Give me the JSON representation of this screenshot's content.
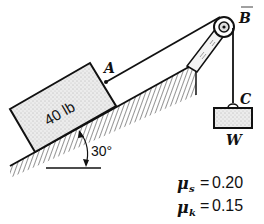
{
  "figure": {
    "type": "statics-problem",
    "block": {
      "label": "40 lb"
    },
    "points": {
      "A": "A",
      "B": "B",
      "C": "C"
    },
    "hanging_weight": {
      "label": "W"
    },
    "incline_angle": {
      "label": "30°"
    },
    "friction": {
      "static": {
        "symbol": "μ",
        "subscript": "s",
        "equals": "=",
        "value": "0.20"
      },
      "kinetic": {
        "symbol": "μ",
        "subscript": "k",
        "equals": "=",
        "value": "0.15"
      }
    },
    "colors": {
      "ink": "#111111",
      "background": "#ffffff",
      "block_fill": "#e6e6e6"
    }
  }
}
